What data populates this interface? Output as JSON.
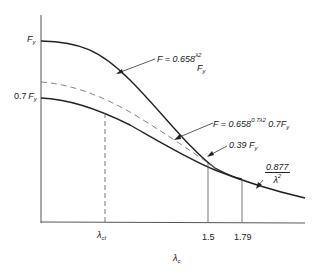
{
  "diagram": {
    "type": "column strength curve",
    "y_axis": {
      "ticks": [
        {
          "label_italic": "F",
          "sub": "y",
          "prefix": ""
        },
        {
          "label_italic": "F",
          "sub": "y",
          "prefix": "0.7"
        }
      ]
    },
    "x_axis": {
      "label": "λ",
      "label_sub": "c",
      "ticks": [
        {
          "label": "λ",
          "sub": "ct"
        },
        {
          "label": "1.5"
        },
        {
          "label": "1.79"
        }
      ]
    },
    "annotations": {
      "upper_curve": {
        "prefix": "F = 0.658",
        "exp": "λ",
        "exp_sub": "c",
        "exp_sup": "2",
        "suffix": "F",
        "suffix_sub": "y"
      },
      "lower_curve": {
        "prefix": "F = 0.658",
        "exp": "0.7λ",
        "exp_sub": "c",
        "exp_sup": "2",
        "suffix": "0.7F",
        "suffix_sub": "y"
      },
      "point": {
        "prefix": "0.39 ",
        "suffix": "F",
        "suffix_sub": "y"
      },
      "euler": {
        "numerator": "0.877",
        "denominator": "λ",
        "den_sub": "c",
        "den_sup": "2"
      }
    }
  },
  "colors": {
    "line": "#222222",
    "dashed": "#777777",
    "guide": "#555555"
  }
}
